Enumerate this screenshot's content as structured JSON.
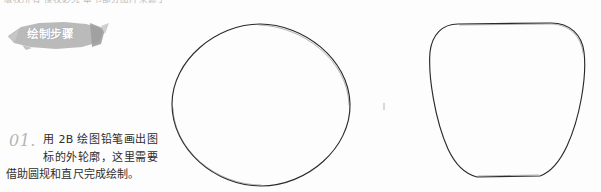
{
  "page": {
    "background_color": "#fdfdfd",
    "width": 601,
    "height": 192
  },
  "top_cropped_line": {
    "text": "版权所有 侵权必究 本书部分图片来源于网络"
  },
  "banner": {
    "label": "绘制步骤",
    "fill_color": "#b0b0b0",
    "text_color": "#ffffff"
  },
  "step": {
    "number": "01.",
    "number_color": "#b5b5b5",
    "text": "用 2B 绘图铅笔画出图标的外轮廓，这里需要借助圆规和直尺完成绘制。",
    "lines": [
      "用 2B 绘图铅笔画",
      "出图标的外轮廓，这里需要",
      "借助圆规和直尺完成绘制。"
    ]
  },
  "figures": [
    {
      "name": "circle",
      "description": "手绘铅笔圆形外轮廓",
      "stroke_color": "#2a2a2a"
    },
    {
      "name": "rounded-triangle",
      "description": "圆角三角形外轮廓",
      "stroke_color": "#2a2a2a"
    }
  ]
}
